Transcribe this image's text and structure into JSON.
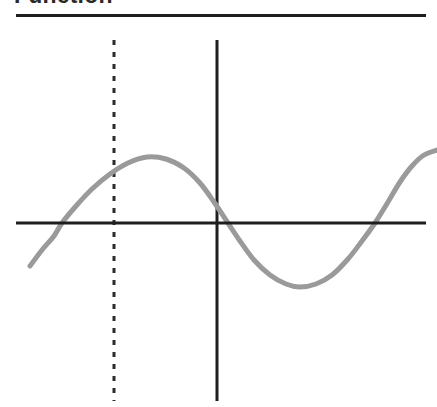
{
  "page": {
    "width": 437,
    "height": 407,
    "background": "#ffffff"
  },
  "header": {
    "title": "Function",
    "title_color": "#2a2a2a",
    "rule": {
      "name": "title-rule",
      "x1": 16,
      "x2": 426,
      "y": 15,
      "thickness": 3,
      "color": "#1e1e1e"
    }
  },
  "chart_data": {
    "type": "line",
    "title": "Function",
    "xlabel": "",
    "ylabel": "",
    "grid": false,
    "legend": null,
    "xlim": [
      0,
      437
    ],
    "ylim": [
      407,
      0
    ],
    "axes": {
      "x_axis": {
        "name": "x-axis",
        "orientation": "horizontal",
        "y": 223,
        "x1": 16,
        "x2": 426,
        "color": "#1e1e1e",
        "thickness": 3,
        "style": "solid"
      },
      "y_axis": {
        "name": "y-axis",
        "orientation": "vertical",
        "x": 217,
        "y1": 40,
        "y2": 401,
        "color": "#1e1e1e",
        "thickness": 3,
        "style": "solid"
      }
    },
    "reference_line": {
      "name": "dashed-vertical-reference-line",
      "orientation": "vertical",
      "x": 114,
      "y1": 40,
      "y2": 401,
      "color": "#2b2b2b",
      "thickness": 3,
      "style": "dashed",
      "dash_length": 5,
      "gap_length": 7
    },
    "curve": {
      "name": "function-curve",
      "color": "#9a9a9a",
      "thickness": 5,
      "style": "solid",
      "shape": "sine-like wave",
      "points": [
        [
          30,
          266
        ],
        [
          42,
          250
        ],
        [
          54,
          236
        ],
        [
          62,
          223
        ],
        [
          76,
          206
        ],
        [
          92,
          189
        ],
        [
          110,
          174
        ],
        [
          128,
          163
        ],
        [
          147,
          157
        ],
        [
          166,
          159
        ],
        [
          184,
          168
        ],
        [
          200,
          183
        ],
        [
          214,
          202
        ],
        [
          228,
          223
        ],
        [
          240,
          241
        ],
        [
          254,
          260
        ],
        [
          270,
          275
        ],
        [
          286,
          284
        ],
        [
          300,
          287
        ],
        [
          316,
          284
        ],
        [
          332,
          275
        ],
        [
          348,
          259
        ],
        [
          362,
          241
        ],
        [
          375,
          223
        ],
        [
          388,
          202
        ],
        [
          400,
          182
        ],
        [
          412,
          166
        ],
        [
          424,
          155
        ],
        [
          437,
          150
        ]
      ],
      "x_intercepts": [
        62,
        228,
        375
      ],
      "peak": [
        147,
        157
      ],
      "trough": [
        300,
        287
      ]
    }
  }
}
